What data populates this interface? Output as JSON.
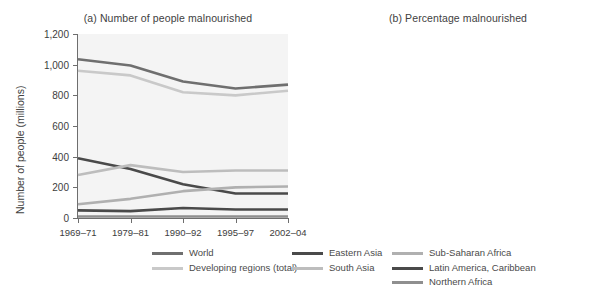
{
  "figure": {
    "panel_a_title": "(a) Number of people malnourished",
    "panel_b_title": "(b) Percentage malnourished",
    "panel_a_ylabel": "Number of people (millions)",
    "panel_b_ylabel": "Percentage"
  },
  "legend": {
    "columns": [
      [
        {
          "label": "World",
          "color": "#6f6f6f"
        },
        {
          "label": "Developing regions (total)",
          "color": "#c9c9c9"
        }
      ],
      [
        {
          "label": "Eastern Asia",
          "color": "#4a4a4a"
        },
        {
          "label": "South Asia",
          "color": "#bdbdbd"
        }
      ],
      [
        {
          "label": "Sub-Saharan Africa",
          "color": "#b0b0b0"
        },
        {
          "label": "Latin America, Caribbean",
          "color": "#4a4a4a"
        },
        {
          "label": "Northern Africa",
          "color": "#8f8f8f"
        }
      ]
    ]
  },
  "chart_data": [
    {
      "type": "line",
      "title": "(a) Number of people malnourished",
      "xlabel": "",
      "ylabel": "Number of people (millions)",
      "categories": [
        "1969–71",
        "1979–81",
        "1990–92",
        "1995–97",
        "2002–04"
      ],
      "ylim": [
        0,
        1200
      ],
      "yticks": [
        0,
        200,
        400,
        600,
        800,
        1000,
        1200
      ],
      "ytick_labels": [
        "0",
        "200",
        "400",
        "600",
        "800",
        "1,000",
        "1,200"
      ],
      "grid": false,
      "legend_position": "below",
      "series": [
        {
          "name": "World",
          "color": "#6f6f6f",
          "values": [
            1035,
            995,
            890,
            845,
            870
          ]
        },
        {
          "name": "Developing regions (total)",
          "color": "#c9c9c9",
          "values": [
            960,
            930,
            820,
            800,
            830
          ]
        },
        {
          "name": "Eastern Asia",
          "color": "#4a4a4a",
          "values": [
            390,
            320,
            220,
            160,
            160
          ]
        },
        {
          "name": "South Asia",
          "color": "#bdbdbd",
          "values": [
            280,
            345,
            300,
            310,
            310
          ]
        },
        {
          "name": "Sub-Saharan Africa",
          "color": "#b0b0b0",
          "values": [
            90,
            125,
            175,
            200,
            205
          ]
        },
        {
          "name": "Latin America, Caribbean",
          "color": "#4a4a4a",
          "values": [
            50,
            45,
            65,
            55,
            55
          ]
        },
        {
          "name": "Northern Africa",
          "color": "#8f8f8f",
          "values": [
            10,
            10,
            10,
            10,
            10
          ]
        }
      ]
    },
    {
      "type": "line",
      "title": "(b) Percentage malnourished",
      "xlabel": "",
      "ylabel": "Percentage",
      "categories": [
        "1969–71",
        "1979–81",
        "1990–92",
        "1995–97",
        "2002–04"
      ],
      "ylim": [
        0,
        50
      ],
      "yticks": [
        0,
        10,
        20,
        30,
        40,
        50
      ],
      "ytick_labels": [
        "0",
        "10",
        "20",
        "30",
        "40",
        "50"
      ],
      "grid": false,
      "legend_position": "below",
      "series": [
        {
          "name": "Eastern Asia",
          "color": "#4a4a4a",
          "values": [
            44.8,
            29.5,
            16.5,
            12.0,
            12.0
          ]
        },
        {
          "name": "Sub-Saharan Africa",
          "color": "#b0b0b0",
          "values": [
            37.0,
            36.5,
            32.5,
            33.5,
            30.8
          ]
        },
        {
          "name": "South Asia",
          "color": "#bdbdbd",
          "values": [
            37.2,
            33.8,
            24.7,
            22.2,
            20.9
          ]
        },
        {
          "name": "World",
          "color": "#6f6f6f",
          "values": [
            32.6,
            24.0,
            19.5,
            17.8,
            16.9
          ]
        },
        {
          "name": "Developing regions (total)",
          "color": "#c9c9c9",
          "values": [
            27.9,
            21.8,
            16.2,
            12.9,
            13.7
          ]
        },
        {
          "name": "Latin America, Caribbean",
          "color": "#4a4a4a",
          "values": [
            19.8,
            13.0,
            13.0,
            10.8,
            10.0
          ]
        },
        {
          "name": "Northern Africa",
          "color": "#8f8f8f",
          "values": [
            26.8,
            7.6,
            3.5,
            3.8,
            3.8
          ]
        }
      ]
    }
  ]
}
